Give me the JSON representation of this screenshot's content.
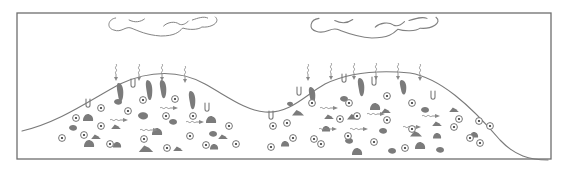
{
  "diagram": {
    "frame": {
      "x": 17,
      "y": 13,
      "w": 534,
      "h": 146
    },
    "colors": {
      "stroke": "#7a7a7a",
      "fill": "#7b7b7b",
      "background": "#ffffff"
    },
    "clouds": [
      {
        "name": "cloud-left",
        "x": 108,
        "y": 14,
        "w": 115,
        "h": 22
      },
      {
        "name": "cloud-right",
        "x": 310,
        "y": 14,
        "w": 135,
        "h": 24
      }
    ],
    "surface_path": "M22,131 C60,122 90,100 120,84 C150,70 180,70 205,84 C230,98 245,110 265,112 C290,114 305,95 325,84 C350,72 380,70 410,73 C440,78 470,105 500,140 C515,156 530,160 548,160",
    "rain_arrows": [
      {
        "x": 116,
        "y": 64
      },
      {
        "x": 139,
        "y": 64
      },
      {
        "x": 162,
        "y": 64
      },
      {
        "x": 185,
        "y": 66
      },
      {
        "x": 308,
        "y": 64
      },
      {
        "x": 331,
        "y": 63
      },
      {
        "x": 354,
        "y": 63
      },
      {
        "x": 376,
        "y": 63
      },
      {
        "x": 398,
        "y": 63
      },
      {
        "x": 420,
        "y": 64
      }
    ],
    "surface_drips": [
      {
        "x": 88,
        "y": 100
      },
      {
        "x": 133,
        "y": 80
      },
      {
        "x": 207,
        "y": 104
      },
      {
        "x": 271,
        "y": 112
      },
      {
        "x": 299,
        "y": 88
      },
      {
        "x": 344,
        "y": 75
      },
      {
        "x": 374,
        "y": 78
      },
      {
        "x": 433,
        "y": 92
      }
    ],
    "channels": [
      {
        "x": 120,
        "y": 83,
        "h": 20
      },
      {
        "x": 149,
        "y": 80,
        "h": 22
      },
      {
        "x": 163,
        "y": 80,
        "h": 20
      },
      {
        "x": 192,
        "y": 91,
        "h": 20
      },
      {
        "x": 312,
        "y": 87,
        "h": 18
      },
      {
        "x": 361,
        "y": 78,
        "h": 20
      },
      {
        "x": 403,
        "y": 80,
        "h": 16
      }
    ],
    "organisms": [
      {
        "x": 62,
        "y": 138
      },
      {
        "x": 76,
        "y": 118
      },
      {
        "x": 84,
        "y": 135
      },
      {
        "x": 101,
        "y": 108
      },
      {
        "x": 101,
        "y": 126
      },
      {
        "x": 110,
        "y": 144
      },
      {
        "x": 128,
        "y": 111
      },
      {
        "x": 143,
        "y": 100
      },
      {
        "x": 144,
        "y": 139
      },
      {
        "x": 166,
        "y": 116
      },
      {
        "x": 167,
        "y": 148
      },
      {
        "x": 175,
        "y": 99
      },
      {
        "x": 193,
        "y": 116
      },
      {
        "x": 190,
        "y": 136
      },
      {
        "x": 206,
        "y": 145
      },
      {
        "x": 229,
        "y": 126
      },
      {
        "x": 236,
        "y": 144
      },
      {
        "x": 273,
        "y": 126
      },
      {
        "x": 271,
        "y": 147
      },
      {
        "x": 287,
        "y": 123
      },
      {
        "x": 293,
        "y": 138
      },
      {
        "x": 312,
        "y": 103
      },
      {
        "x": 314,
        "y": 139
      },
      {
        "x": 321,
        "y": 144
      },
      {
        "x": 340,
        "y": 119
      },
      {
        "x": 348,
        "y": 136
      },
      {
        "x": 349,
        "y": 103
      },
      {
        "x": 357,
        "y": 116
      },
      {
        "x": 374,
        "y": 142
      },
      {
        "x": 387,
        "y": 120
      },
      {
        "x": 387,
        "y": 96
      },
      {
        "x": 405,
        "y": 148
      },
      {
        "x": 412,
        "y": 103
      },
      {
        "x": 412,
        "y": 129
      },
      {
        "x": 454,
        "y": 127
      },
      {
        "x": 459,
        "y": 119
      },
      {
        "x": 470,
        "y": 138
      },
      {
        "x": 479,
        "y": 121
      },
      {
        "x": 480,
        "y": 143
      },
      {
        "x": 490,
        "y": 126
      }
    ],
    "particles": [
      {
        "x": 88,
        "y": 118,
        "r": 5
      },
      {
        "x": 73,
        "y": 128,
        "r": 4
      },
      {
        "x": 96,
        "y": 137,
        "r": 4
      },
      {
        "x": 89,
        "y": 144,
        "r": 5
      },
      {
        "x": 118,
        "y": 102,
        "r": 4
      },
      {
        "x": 116,
        "y": 127,
        "r": 4
      },
      {
        "x": 117,
        "y": 145,
        "r": 4
      },
      {
        "x": 143,
        "y": 116,
        "r": 5
      },
      {
        "x": 146,
        "y": 149,
        "r": 6
      },
      {
        "x": 157,
        "y": 132,
        "r": 5
      },
      {
        "x": 173,
        "y": 122,
        "r": 4
      },
      {
        "x": 178,
        "y": 149,
        "r": 4
      },
      {
        "x": 211,
        "y": 120,
        "r": 5
      },
      {
        "x": 213,
        "y": 134,
        "r": 4
      },
      {
        "x": 223,
        "y": 137,
        "r": 4
      },
      {
        "x": 214,
        "y": 147,
        "r": 4
      },
      {
        "x": 290,
        "y": 104,
        "r": 3
      },
      {
        "x": 298,
        "y": 113,
        "r": 5
      },
      {
        "x": 285,
        "y": 144,
        "r": 4
      },
      {
        "x": 344,
        "y": 99,
        "r": 4
      },
      {
        "x": 329,
        "y": 117,
        "r": 4
      },
      {
        "x": 326,
        "y": 129,
        "r": 4
      },
      {
        "x": 349,
        "y": 141,
        "r": 4
      },
      {
        "x": 353,
        "y": 117,
        "r": 5
      },
      {
        "x": 375,
        "y": 107,
        "r": 5
      },
      {
        "x": 383,
        "y": 131,
        "r": 4
      },
      {
        "x": 386,
        "y": 111,
        "r": 4
      },
      {
        "x": 357,
        "y": 152,
        "r": 5
      },
      {
        "x": 392,
        "y": 151,
        "r": 4
      },
      {
        "x": 416,
        "y": 134,
        "r": 5
      },
      {
        "x": 420,
        "y": 146,
        "r": 5
      },
      {
        "x": 425,
        "y": 110,
        "r": 4
      },
      {
        "x": 437,
        "y": 124,
        "r": 4
      },
      {
        "x": 437,
        "y": 136,
        "r": 4
      },
      {
        "x": 440,
        "y": 150,
        "r": 4
      },
      {
        "x": 454,
        "y": 110,
        "r": 4
      },
      {
        "x": 474,
        "y": 135,
        "r": 4
      }
    ],
    "flow_arrows": [
      {
        "x": 110,
        "y": 120
      },
      {
        "x": 140,
        "y": 130
      },
      {
        "x": 160,
        "y": 108
      },
      {
        "x": 186,
        "y": 122
      },
      {
        "x": 320,
        "y": 108
      },
      {
        "x": 319,
        "y": 129
      },
      {
        "x": 350,
        "y": 129
      },
      {
        "x": 367,
        "y": 114
      },
      {
        "x": 403,
        "y": 127
      },
      {
        "x": 422,
        "y": 116
      }
    ]
  }
}
